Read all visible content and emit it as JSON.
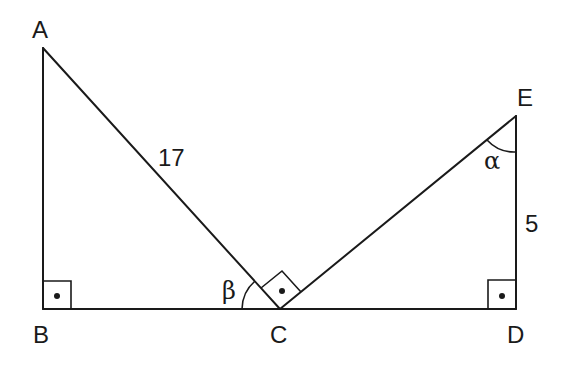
{
  "diagram": {
    "type": "geometry",
    "vertices": {
      "A": {
        "label": "A",
        "x": 43,
        "y": 48
      },
      "B": {
        "label": "B",
        "x": 43,
        "y": 309
      },
      "C": {
        "label": "C",
        "x": 280,
        "y": 309
      },
      "D": {
        "label": "D",
        "x": 516,
        "y": 309
      },
      "E": {
        "label": "E",
        "x": 516,
        "y": 116
      }
    },
    "segments": [
      {
        "from": "A",
        "to": "B"
      },
      {
        "from": "A",
        "to": "C",
        "length_label": "17"
      },
      {
        "from": "B",
        "to": "D"
      },
      {
        "from": "C",
        "to": "E"
      },
      {
        "from": "E",
        "to": "D",
        "length_label": "5"
      }
    ],
    "right_angles": [
      "B",
      "C",
      "D"
    ],
    "angles": [
      {
        "vertex": "C",
        "label": "β",
        "between": [
          "B",
          "A"
        ]
      },
      {
        "vertex": "E",
        "label": "α",
        "between": [
          "C",
          "D"
        ]
      }
    ],
    "labels": {
      "A": "A",
      "B": "B",
      "C": "C",
      "D": "D",
      "E": "E",
      "ac_length": "17",
      "ed_length": "5",
      "beta": "β",
      "alpha": "α"
    }
  }
}
